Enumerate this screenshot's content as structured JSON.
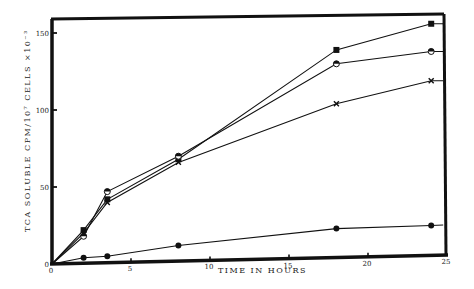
{
  "chart_data": {
    "type": "line",
    "title": "",
    "xlabel": "TIME IN HOURS",
    "ylabel": "TCA SOLUBLE CPM/10⁷ CELLS ×10⁻³",
    "xlim": [
      0,
      25
    ],
    "ylim": [
      0,
      160
    ],
    "xticks": [
      0,
      5,
      10,
      15,
      20,
      25
    ],
    "yticks": [
      0,
      50,
      100,
      150
    ],
    "xtick_labels": [
      "0",
      "5",
      "10",
      "15",
      "20",
      "25"
    ],
    "ytick_labels": [
      "0",
      "50",
      "100",
      "150"
    ],
    "grid": false,
    "legend": "none",
    "series": [
      {
        "name": "filled-square",
        "marker": "square",
        "x": [
          0,
          2,
          3.5,
          8,
          18,
          24
        ],
        "values": [
          0,
          22,
          42,
          68,
          139,
          156
        ]
      },
      {
        "name": "half-filled-circle",
        "marker": "half-circle",
        "x": [
          0,
          2,
          3.5,
          8,
          18,
          24
        ],
        "values": [
          0,
          18,
          47,
          70,
          130,
          138
        ]
      },
      {
        "name": "cross",
        "marker": "x",
        "x": [
          0,
          2,
          3.5,
          8,
          18,
          24
        ],
        "values": [
          0,
          20,
          40,
          66,
          104,
          119
        ]
      },
      {
        "name": "filled-circle",
        "marker": "circle",
        "x": [
          0,
          2,
          3.5,
          8,
          18,
          24
        ],
        "values": [
          0,
          4,
          5,
          12,
          23,
          25
        ]
      }
    ]
  }
}
